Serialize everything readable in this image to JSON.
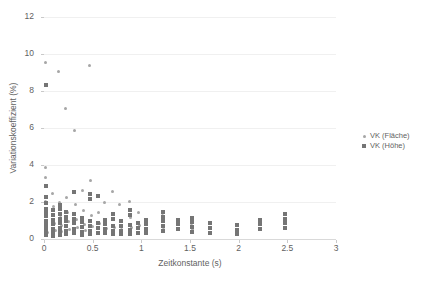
{
  "chart_data": {
    "type": "scatter",
    "title": "",
    "xlabel": "Zeitkonstante (s)",
    "ylabel": "Variationskoeffizient (%)",
    "xlim": [
      0,
      3
    ],
    "ylim": [
      0,
      12
    ],
    "xticks": [
      "0",
      "0.5",
      "1",
      "1.5",
      "2",
      "2.5",
      "3"
    ],
    "xtick_values": [
      0,
      0.5,
      1,
      1.5,
      2,
      2.5,
      3
    ],
    "yticks": [
      "0",
      "2",
      "4",
      "6",
      "8",
      "10",
      "12"
    ],
    "ytick_values": [
      0,
      2,
      4,
      6,
      8,
      10,
      12
    ],
    "grid": "horizontal",
    "legend_position": "right",
    "series": [
      {
        "name": "VK (Fläche)",
        "marker": "circle",
        "color": "#a6a6a6",
        "points": [
          [
            0.02,
            9.55
          ],
          [
            0.02,
            3.85
          ],
          [
            0.02,
            3.35
          ],
          [
            0.02,
            2.05
          ],
          [
            0.02,
            1.55
          ],
          [
            0.02,
            1.25
          ],
          [
            0.02,
            0.95
          ],
          [
            0.03,
            0.55
          ],
          [
            0.04,
            0.35
          ],
          [
            0.09,
            2.45
          ],
          [
            0.1,
            1.75
          ],
          [
            0.1,
            1.35
          ],
          [
            0.11,
            0.85
          ],
          [
            0.12,
            0.45
          ],
          [
            0.15,
            9.05
          ],
          [
            0.16,
            1.95
          ],
          [
            0.17,
            1.15
          ],
          [
            0.18,
            0.75
          ],
          [
            0.18,
            0.4
          ],
          [
            0.22,
            7.05
          ],
          [
            0.23,
            2.25
          ],
          [
            0.24,
            1.45
          ],
          [
            0.25,
            0.95
          ],
          [
            0.26,
            0.5
          ],
          [
            0.31,
            5.85
          ],
          [
            0.32,
            1.85
          ],
          [
            0.33,
            1.05
          ],
          [
            0.34,
            0.6
          ],
          [
            0.4,
            2.65
          ],
          [
            0.41,
            1.55
          ],
          [
            0.42,
            0.8
          ],
          [
            0.43,
            0.45
          ],
          [
            0.47,
            9.4
          ],
          [
            0.48,
            3.15
          ],
          [
            0.49,
            1.25
          ],
          [
            0.5,
            0.7
          ],
          [
            0.55,
            2.35
          ],
          [
            0.56,
            1.45
          ],
          [
            0.57,
            0.85
          ],
          [
            0.62,
            1.95
          ],
          [
            0.63,
            1.05
          ],
          [
            0.64,
            0.55
          ],
          [
            0.7,
            2.55
          ],
          [
            0.71,
            1.35
          ],
          [
            0.72,
            0.65
          ],
          [
            0.78,
            1.85
          ],
          [
            0.79,
            0.95
          ],
          [
            0.8,
            0.5
          ],
          [
            0.88,
            2.05
          ],
          [
            0.89,
            1.15
          ],
          [
            0.9,
            0.6
          ],
          [
            0.97,
            1.45
          ],
          [
            0.98,
            0.75
          ],
          [
            1.22,
            1.25
          ],
          [
            1.23,
            0.65
          ],
          [
            1.52,
            0.85
          ],
          [
            1.53,
            0.5
          ]
        ]
      },
      {
        "name": "VK (Höhe)",
        "marker": "square",
        "color": "#757575",
        "points": [
          [
            0.02,
            8.35
          ],
          [
            0.02,
            2.85
          ],
          [
            0.02,
            2.25
          ],
          [
            0.02,
            1.95
          ],
          [
            0.02,
            1.65
          ],
          [
            0.02,
            1.45
          ],
          [
            0.02,
            1.25
          ],
          [
            0.02,
            0.95
          ],
          [
            0.02,
            0.75
          ],
          [
            0.02,
            0.55
          ],
          [
            0.02,
            0.35
          ],
          [
            0.02,
            0.2
          ],
          [
            0.09,
            1.55
          ],
          [
            0.09,
            1.3
          ],
          [
            0.09,
            1.05
          ],
          [
            0.09,
            0.8
          ],
          [
            0.09,
            0.55
          ],
          [
            0.09,
            0.35
          ],
          [
            0.09,
            0.18
          ],
          [
            0.16,
            1.85
          ],
          [
            0.16,
            1.6
          ],
          [
            0.16,
            1.35
          ],
          [
            0.16,
            1.1
          ],
          [
            0.16,
            0.85
          ],
          [
            0.16,
            0.6
          ],
          [
            0.16,
            0.4
          ],
          [
            0.16,
            0.22
          ],
          [
            0.23,
            1.45
          ],
          [
            0.23,
            1.2
          ],
          [
            0.23,
            0.95
          ],
          [
            0.23,
            0.7
          ],
          [
            0.23,
            0.45
          ],
          [
            0.23,
            0.25
          ],
          [
            0.31,
            2.55
          ],
          [
            0.31,
            1.35
          ],
          [
            0.31,
            1.1
          ],
          [
            0.31,
            0.85
          ],
          [
            0.31,
            0.55
          ],
          [
            0.31,
            0.3
          ],
          [
            0.39,
            1.15
          ],
          [
            0.39,
            0.9
          ],
          [
            0.39,
            0.65
          ],
          [
            0.39,
            0.4
          ],
          [
            0.39,
            0.2
          ],
          [
            0.47,
            2.45
          ],
          [
            0.47,
            2.15
          ],
          [
            0.47,
            0.95
          ],
          [
            0.47,
            0.7
          ],
          [
            0.47,
            0.45
          ],
          [
            0.47,
            0.25
          ],
          [
            0.55,
            2.35
          ],
          [
            0.55,
            0.85
          ],
          [
            0.55,
            0.6
          ],
          [
            0.55,
            0.35
          ],
          [
            0.63,
            1.05
          ],
          [
            0.63,
            0.8
          ],
          [
            0.63,
            0.55
          ],
          [
            0.63,
            0.3
          ],
          [
            0.71,
            1.35
          ],
          [
            0.71,
            1.1
          ],
          [
            0.71,
            0.7
          ],
          [
            0.71,
            0.45
          ],
          [
            0.71,
            0.25
          ],
          [
            0.79,
            0.95
          ],
          [
            0.79,
            0.7
          ],
          [
            0.79,
            0.45
          ],
          [
            0.79,
            0.25
          ],
          [
            0.88,
            1.55
          ],
          [
            0.88,
            1.3
          ],
          [
            0.88,
            0.75
          ],
          [
            0.88,
            0.5
          ],
          [
            0.88,
            0.28
          ],
          [
            0.97,
            0.85
          ],
          [
            0.97,
            0.6
          ],
          [
            0.97,
            0.35
          ],
          [
            1.05,
            1.05
          ],
          [
            1.05,
            0.8
          ],
          [
            1.05,
            0.55
          ],
          [
            1.05,
            0.3
          ],
          [
            1.22,
            1.45
          ],
          [
            1.22,
            1.2
          ],
          [
            1.22,
            0.95
          ],
          [
            1.22,
            0.7
          ],
          [
            1.22,
            0.45
          ],
          [
            1.38,
            1.05
          ],
          [
            1.38,
            0.8
          ],
          [
            1.38,
            0.55
          ],
          [
            1.52,
            1.15
          ],
          [
            1.52,
            0.9
          ],
          [
            1.52,
            0.65
          ],
          [
            1.52,
            0.4
          ],
          [
            1.7,
            0.85
          ],
          [
            1.7,
            0.6
          ],
          [
            1.7,
            0.35
          ],
          [
            1.98,
            0.75
          ],
          [
            1.98,
            0.5
          ],
          [
            1.98,
            0.28
          ],
          [
            2.22,
            1.05
          ],
          [
            2.22,
            0.8
          ],
          [
            2.22,
            0.55
          ],
          [
            2.48,
            1.35
          ],
          [
            2.48,
            1.1
          ],
          [
            2.48,
            0.85
          ],
          [
            2.48,
            0.6
          ]
        ]
      }
    ]
  }
}
